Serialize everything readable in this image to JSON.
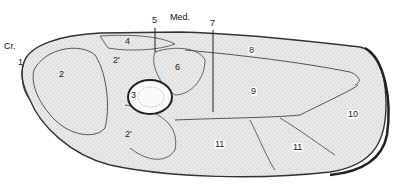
{
  "diagram": {
    "type": "anatomical cross-section",
    "orientation_labels": {
      "cranial": "Cr.",
      "medial": "Med."
    },
    "labels": [
      {
        "id": "1",
        "text": "1",
        "x": 18,
        "y": 58
      },
      {
        "id": "2",
        "text": "2",
        "x": 59,
        "y": 70
      },
      {
        "id": "2p_upper",
        "text": "2'",
        "x": 113,
        "y": 56
      },
      {
        "id": "2p_lower",
        "text": "2'",
        "x": 125,
        "y": 130
      },
      {
        "id": "3",
        "text": "3",
        "x": 131,
        "y": 91
      },
      {
        "id": "4",
        "text": "4",
        "x": 125,
        "y": 37
      },
      {
        "id": "5",
        "text": "5",
        "x": 152,
        "y": 16
      },
      {
        "id": "6",
        "text": "6",
        "x": 175,
        "y": 63
      },
      {
        "id": "7",
        "text": "7",
        "x": 210,
        "y": 19
      },
      {
        "id": "8",
        "text": "8",
        "x": 248,
        "y": 46
      },
      {
        "id": "9",
        "text": "9",
        "x": 250,
        "y": 87
      },
      {
        "id": "10",
        "text": "10",
        "x": 347,
        "y": 110
      },
      {
        "id": "11a",
        "text": "11",
        "x": 214,
        "y": 140
      },
      {
        "id": "11b",
        "text": "11",
        "x": 292,
        "y": 143
      }
    ]
  }
}
